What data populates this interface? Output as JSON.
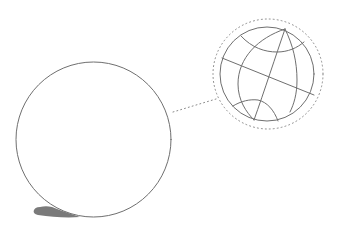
{
  "illustration": {
    "description": "Line drawing of a plain ball with a dotted callout magnifying a globe with latitude and longitude lines",
    "colors": {
      "background": "#ffffff",
      "line": "#6f6f6f",
      "dotted": "#8a8a8a",
      "shadow": "#7a7a7a"
    },
    "ball": {
      "cx": 93.5,
      "cy": 139.5,
      "r": 77.5
    },
    "shadow": {
      "path": "M40 207 C33 207 31 214 38 215 C52 217 66 218 80 217 C70 214 60 210 52 207 C48 206 44 206 40 207 Z"
    },
    "callout": {
      "connector": {
        "x1": 173,
        "y1": 112,
        "x2": 216,
        "y2": 99
      },
      "ring": {
        "cx": 268,
        "cy": 74,
        "r": 55
      }
    },
    "globe": {
      "cx": 267,
      "cy": 74,
      "r": 47,
      "lines": {
        "equator": "M222 58 L314 95",
        "meridian_center": "M285 29 C276 55 264 92 254 120",
        "meridian_left": "M285 29 C258 38 238 58 238 84 C238 100 246 112 254 120",
        "meridian_right": "M285 29 C293 45 297 62 297 80 C297 94 294 104 290 112",
        "arc_top": "M241 36 C252 48 265 52 277 52 C288 52 297 48 304 42",
        "arc_bottom": "M233 106 C241 101 250 99 258 100 C267 102 274 110 278 121"
      }
    }
  }
}
